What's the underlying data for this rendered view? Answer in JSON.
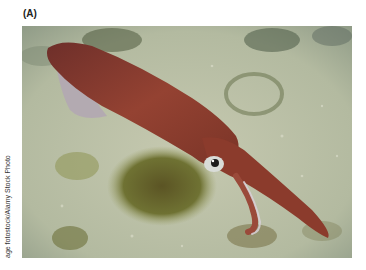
{
  "figure": {
    "panel_label": "(A)",
    "photo_credit": "age fotostock/Alamy Stock Photo",
    "colors": {
      "seafloor": "#b9bfa6",
      "seafloor_dark": "#8f9880",
      "algae": "#6b6a2e",
      "squid_body": "#8a3a2a",
      "squid_fin": "#b7a7b0"
    }
  }
}
